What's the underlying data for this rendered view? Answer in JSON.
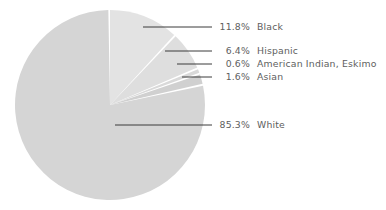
{
  "chart_data": {
    "type": "pie",
    "title": "",
    "subtitle": "",
    "xlabel": "",
    "ylabel": "",
    "legend_position": "callout-labels-right",
    "grid": false,
    "value_suffix": "%",
    "categories": [
      "Black",
      "Hispanic",
      "American Indian, Eskimo",
      "Asian",
      "White"
    ],
    "values": [
      11.8,
      6.4,
      0.6,
      1.6,
      85.3
    ],
    "slices": [
      {
        "label": "Black",
        "value": 11.8,
        "value_text": "11.8%",
        "color": "#e3e3e3",
        "start_angle": 0,
        "end_angle": 42.5,
        "leader_x1": 143,
        "leader_y1": 27,
        "leader_x2": 212,
        "leader_y2": 27,
        "label_x": 168,
        "label_y": 22
      },
      {
        "label": "Hispanic",
        "value": 6.4,
        "value_text": "6.4%",
        "color": "#dedede",
        "start_angle": 43.7,
        "end_angle": 66.7,
        "leader_x1": 165,
        "leader_y1": 51,
        "leader_x2": 212,
        "leader_y2": 51,
        "label_x": 168,
        "label_y": 46
      },
      {
        "label": "American Indian, Eskimo",
        "value": 0.6,
        "value_text": "0.6%",
        "color": "#d9d9d9",
        "start_angle": 67.9,
        "end_angle": 70.1,
        "leader_x1": 177,
        "leader_y1": 64,
        "leader_x2": 212,
        "leader_y2": 64,
        "label_x": 168,
        "label_y": 59
      },
      {
        "label": "Asian",
        "value": 1.6,
        "value_text": "1.6%",
        "color": "#d0d0d0",
        "start_angle": 71.3,
        "end_angle": 77.1,
        "leader_x1": 182,
        "leader_y1": 77,
        "leader_x2": 212,
        "leader_y2": 77,
        "label_x": 168,
        "label_y": 72
      },
      {
        "label": "White",
        "value": 85.3,
        "value_text": "85.3%",
        "color": "#d5d5d5",
        "start_angle": 78.3,
        "end_angle": 359.0,
        "leader_x1": 115,
        "leader_y1": 125,
        "leader_x2": 212,
        "leader_y2": 125,
        "label_x": 168,
        "label_y": 120
      }
    ],
    "geometry": {
      "center_x": 110,
      "center_y": 105,
      "radius": 95,
      "gap_color": "#ffffff"
    }
  },
  "colors": {
    "background": "#ffffff",
    "text": "#5e5e5e",
    "leader_line": "#3a3a3a"
  }
}
